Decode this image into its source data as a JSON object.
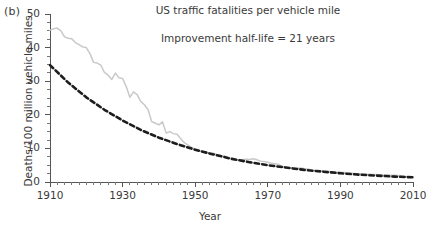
{
  "panel": {
    "label": "(b)"
  },
  "chart_data": {
    "type": "line",
    "title": "US traffic fatalities per vehicle mile",
    "annotation": "Improvement half-life = 21 years",
    "xlabel": "Year",
    "ylabel": "Deaths/100 million vehicle miles",
    "xlim": [
      1910,
      2010
    ],
    "ylim": [
      0,
      50
    ],
    "grid": false,
    "legend_position": "none",
    "x_ticks_major": [
      1910,
      1930,
      1950,
      1970,
      1990,
      2010
    ],
    "x_tick_minor_step": 2,
    "y_ticks_major": [
      0,
      10,
      20,
      30,
      40,
      50
    ],
    "y_tick_minor_step": 2.5,
    "series": [
      {
        "name": "Observed fatality rate",
        "style": "solid",
        "color": "#c9c9c9",
        "x": [
          1910,
          1911,
          1912,
          1913,
          1914,
          1915,
          1916,
          1917,
          1918,
          1919,
          1920,
          1921,
          1922,
          1923,
          1924,
          1925,
          1926,
          1927,
          1928,
          1929,
          1930,
          1931,
          1932,
          1933,
          1934,
          1935,
          1936,
          1937,
          1938,
          1939,
          1940,
          1941,
          1942,
          1943,
          1944,
          1945,
          1946,
          1947,
          1948,
          1949,
          1950,
          1951,
          1952,
          1953,
          1954,
          1955,
          1956,
          1957,
          1958,
          1959,
          1960,
          1961,
          1962,
          1963,
          1964,
          1965,
          1966,
          1967,
          1968,
          1969,
          1970,
          1971,
          1972,
          1973,
          1974,
          1975,
          1976,
          1977,
          1978,
          1979,
          1980,
          1981,
          1982,
          1983,
          1984,
          1985,
          1986,
          1987,
          1988,
          1989,
          1990,
          1991,
          1992,
          1993,
          1994,
          1995,
          1996,
          1997,
          1998,
          1999,
          2000,
          2001,
          2002,
          2003,
          2004,
          2005,
          2006,
          2007,
          2008,
          2009,
          2010
        ],
        "y": [
          45.2,
          45.6,
          45.8,
          45.0,
          43.2,
          42.8,
          42.6,
          41.5,
          40.9,
          40.2,
          40.0,
          38.2,
          35.6,
          35.4,
          34.8,
          32.6,
          31.8,
          30.5,
          32.4,
          31.0,
          30.8,
          28.4,
          25.2,
          26.8,
          26.0,
          24.0,
          23.0,
          21.6,
          18.0,
          17.5,
          17.0,
          17.9,
          14.6,
          15.0,
          14.4,
          14.2,
          12.9,
          11.7,
          11.0,
          10.3,
          9.8,
          9.5,
          9.0,
          8.8,
          8.5,
          8.6,
          8.2,
          7.9,
          7.7,
          7.3,
          7.0,
          6.7,
          6.5,
          6.6,
          6.8,
          6.7,
          6.9,
          6.6,
          6.2,
          6.1,
          5.9,
          5.6,
          5.4,
          5.2,
          4.6,
          4.3,
          4.2,
          4.2,
          4.1,
          4.2,
          4.0,
          3.9,
          3.6,
          3.4,
          3.3,
          3.2,
          3.1,
          3.1,
          3.0,
          2.9,
          2.9,
          2.8,
          2.7,
          2.6,
          2.5,
          2.4,
          2.4,
          2.3,
          2.3,
          2.2,
          2.2,
          2.1,
          2.1,
          2.1,
          2.0,
          2.0,
          1.9,
          1.8,
          1.6,
          1.5,
          1.4
        ]
      },
      {
        "name": "Exponential fit (half-life 21 years)",
        "style": "dashed",
        "color": "#1d1d1d",
        "half_life_years": 21,
        "x": [
          1910,
          1915,
          1920,
          1925,
          1930,
          1935,
          1940,
          1945,
          1950,
          1955,
          1960,
          1965,
          1970,
          1975,
          1980,
          1985,
          1990,
          1995,
          2000,
          2005,
          2010
        ],
        "y": [
          34.8,
          29.6,
          25.2,
          21.5,
          18.3,
          15.5,
          13.2,
          11.3,
          9.6,
          8.2,
          6.9,
          5.9,
          5.0,
          4.3,
          3.6,
          3.1,
          2.6,
          2.2,
          1.9,
          1.6,
          1.4
        ]
      }
    ]
  }
}
